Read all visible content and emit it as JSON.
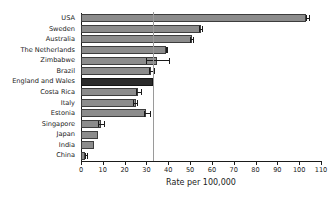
{
  "chart_data": {
    "type": "bar",
    "orientation": "horizontal",
    "title": "",
    "subtitle": "",
    "xlabel": "Rate per 100,000",
    "ylabel": "",
    "xlim": [
      0,
      110
    ],
    "ylim": null,
    "grid": false,
    "legend": null,
    "xticks": [
      0,
      10,
      20,
      30,
      40,
      50,
      60,
      70,
      80,
      90,
      100,
      110
    ],
    "xticklabels": [
      "0",
      "10",
      "20",
      "30",
      "40",
      "50",
      "60",
      "70",
      "80",
      "90",
      "100",
      "110"
    ],
    "categories": [
      "USA",
      "Sweden",
      "Australia",
      "The Netherlands",
      "Zimbabwe",
      "Brazil",
      "England and Wales",
      "Costa Rica",
      "Italy",
      "Estonia",
      "Singapore",
      "Japan",
      "India",
      "China"
    ],
    "values": [
      103,
      55,
      51,
      39,
      35,
      32,
      33,
      26,
      25,
      30,
      9,
      8,
      6,
      2
    ],
    "errors_low": [
      103,
      54,
      50,
      39,
      30,
      31,
      33,
      25,
      24,
      29,
      8,
      8,
      6,
      2
    ],
    "errors_high": [
      105,
      56,
      52,
      40,
      41,
      34,
      33,
      28,
      26,
      32,
      11,
      8,
      6,
      3
    ],
    "highlight_category": "England and Wales",
    "reference_line": 33,
    "annotations": [],
    "colors": {
      "bar_fill": "#8c8c8c",
      "bar_edge": "#3d3d3d",
      "highlight_fill": "#2b2b2b",
      "highlight_edge": "#151515",
      "error_bar": "#1b1b1b",
      "reference_line": "#9a9a9a",
      "axis": "#1b1b1b",
      "text": "#1b1b1b",
      "background": "#ffffff"
    }
  }
}
